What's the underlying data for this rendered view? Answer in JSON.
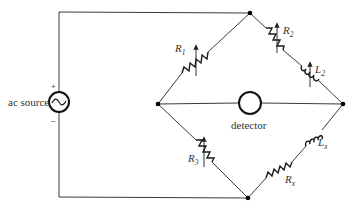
{
  "diagram": {
    "type": "circuit-schematic",
    "source": {
      "label": "ac source",
      "plus_sign": "+",
      "minus_sign": "−",
      "symbol": "sine-wave-icon"
    },
    "detector": {
      "label": "detector"
    },
    "components": [
      {
        "id": "R1",
        "letter": "R",
        "subscript": "1",
        "kind": "variable-resistor",
        "branch": "top-left"
      },
      {
        "id": "R2",
        "letter": "R",
        "subscript": "2",
        "kind": "variable-resistor",
        "branch": "top-right"
      },
      {
        "id": "L2",
        "letter": "L",
        "subscript": "2",
        "kind": "variable-inductor",
        "branch": "top-right"
      },
      {
        "id": "R3",
        "letter": "R",
        "subscript": "3",
        "kind": "variable-resistor",
        "branch": "bottom-left"
      },
      {
        "id": "Lx",
        "letter": "L",
        "subscript": "x",
        "kind": "inductor",
        "branch": "bottom-right"
      },
      {
        "id": "Rx",
        "letter": "R",
        "subscript": "x",
        "kind": "resistor",
        "branch": "bottom-right"
      }
    ],
    "colors": {
      "wire": "#3a3a3a",
      "component": "#1a1a1a",
      "background": "#ffffff"
    }
  }
}
